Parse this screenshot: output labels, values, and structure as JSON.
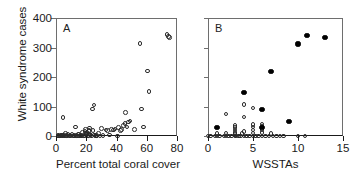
{
  "figure": {
    "ylabel": "White syndrome cases",
    "panels": [
      "A",
      "B"
    ]
  },
  "chart_data": [
    {
      "type": "scatter",
      "panel": "A",
      "title": "A",
      "xlabel": "Percent total coral cover",
      "ylabel": "White syndrome cases",
      "xlim": [
        0,
        80
      ],
      "ylim": [
        0,
        400
      ],
      "xticks": [
        0,
        20,
        40,
        60,
        80
      ],
      "yticks": [
        0,
        100,
        200,
        300,
        400
      ],
      "grid": false,
      "legend": "none",
      "marker": "open-circle",
      "series": [
        {
          "name": "survey sites",
          "marker": "open-circle",
          "points": [
            [
              1.2,
              2
            ],
            [
              1.8,
              0
            ],
            [
              2.5,
              1
            ],
            [
              3.0,
              0
            ],
            [
              3.6,
              4
            ],
            [
              4.2,
              0
            ],
            [
              4.6,
              62
            ],
            [
              5.1,
              3
            ],
            [
              5.6,
              0
            ],
            [
              6.2,
              8
            ],
            [
              6.8,
              1
            ],
            [
              7.4,
              0
            ],
            [
              8.0,
              6
            ],
            [
              8.6,
              0
            ],
            [
              9.2,
              2
            ],
            [
              10.0,
              0
            ],
            [
              10.6,
              5
            ],
            [
              11.2,
              0
            ],
            [
              11.8,
              1
            ],
            [
              12.4,
              0
            ],
            [
              13.0,
              30
            ],
            [
              13.6,
              2
            ],
            [
              14.2,
              0
            ],
            [
              15.0,
              7
            ],
            [
              15.6,
              0
            ],
            [
              16.2,
              3
            ],
            [
              17.0,
              0
            ],
            [
              17.6,
              11
            ],
            [
              18.2,
              1
            ],
            [
              18.8,
              0
            ],
            [
              19.2,
              16
            ],
            [
              19.6,
              22
            ],
            [
              19.9,
              9
            ],
            [
              20.2,
              5
            ],
            [
              20.6,
              13
            ],
            [
              21.0,
              0
            ],
            [
              21.4,
              2
            ],
            [
              21.8,
              19
            ],
            [
              22.2,
              27
            ],
            [
              22.6,
              7
            ],
            [
              23.0,
              3
            ],
            [
              23.5,
              0
            ],
            [
              24.0,
              92
            ],
            [
              24.4,
              18
            ],
            [
              25.0,
              105
            ],
            [
              25.5,
              4
            ],
            [
              26.0,
              0
            ],
            [
              26.6,
              1
            ],
            [
              27.2,
              0
            ],
            [
              28.0,
              9
            ],
            [
              29.0,
              0
            ],
            [
              30.0,
              25
            ],
            [
              31.0,
              2
            ],
            [
              33.0,
              20
            ],
            [
              34.0,
              18
            ],
            [
              35.5,
              3
            ],
            [
              36.5,
              22
            ],
            [
              38.0,
              20
            ],
            [
              39.0,
              24
            ],
            [
              40.5,
              0
            ],
            [
              41.5,
              28
            ],
            [
              42.5,
              19
            ],
            [
              43.5,
              23
            ],
            [
              44.5,
              36
            ],
            [
              45.5,
              42
            ],
            [
              46.0,
              80
            ],
            [
              47.0,
              30
            ],
            [
              48.0,
              48
            ],
            [
              49.0,
              51
            ],
            [
              52.0,
              22
            ],
            [
              55.5,
              314
            ],
            [
              56.5,
              91
            ],
            [
              58.0,
              30
            ],
            [
              60.5,
              221
            ],
            [
              61.5,
              150
            ],
            [
              73.5,
              345
            ],
            [
              74.5,
              338
            ],
            [
              75.0,
              333
            ]
          ]
        }
      ]
    },
    {
      "type": "scatter",
      "panel": "B",
      "title": "B",
      "xlabel": "WSSTAs",
      "ylabel": "White syndrome cases",
      "xlim": [
        0,
        15
      ],
      "ylim": [
        0,
        400
      ],
      "xticks": [
        0,
        5,
        10,
        15
      ],
      "yticks": [
        0,
        100,
        200,
        300,
        400
      ],
      "grid": false,
      "legend": "none",
      "series": [
        {
          "name": "low coral cover sites",
          "marker": "open-circle",
          "points": [
            [
              0.0,
              0
            ],
            [
              0.3,
              0
            ],
            [
              0.8,
              0
            ],
            [
              1.0,
              0
            ],
            [
              1.0,
              8
            ],
            [
              1.3,
              0
            ],
            [
              1.8,
              0
            ],
            [
              2.0,
              0
            ],
            [
              2.0,
              10
            ],
            [
              2.0,
              75
            ],
            [
              2.3,
              0
            ],
            [
              2.6,
              0
            ],
            [
              3.0,
              0
            ],
            [
              3.0,
              5
            ],
            [
              3.0,
              12
            ],
            [
              3.0,
              20
            ],
            [
              3.0,
              28
            ],
            [
              3.0,
              36
            ],
            [
              3.1,
              0
            ],
            [
              3.4,
              0
            ],
            [
              3.6,
              0
            ],
            [
              3.8,
              8
            ],
            [
              4.0,
              0
            ],
            [
              4.0,
              16
            ],
            [
              4.0,
              64
            ],
            [
              4.0,
              106
            ],
            [
              4.3,
              0
            ],
            [
              4.6,
              0
            ],
            [
              5.0,
              0
            ],
            [
              5.0,
              10
            ],
            [
              5.0,
              20
            ],
            [
              5.0,
              30
            ],
            [
              5.0,
              38
            ],
            [
              5.0,
              95
            ],
            [
              5.3,
              0
            ],
            [
              5.6,
              0
            ],
            [
              6.0,
              0
            ],
            [
              6.0,
              12
            ],
            [
              6.0,
              22
            ],
            [
              6.0,
              32
            ],
            [
              6.0,
              40
            ],
            [
              6.4,
              0
            ],
            [
              6.8,
              0
            ],
            [
              7.0,
              8
            ],
            [
              7.2,
              0
            ],
            [
              7.6,
              0
            ],
            [
              8.0,
              0
            ],
            [
              8.4,
              0
            ],
            [
              10.0,
              0
            ],
            [
              10.8,
              0
            ]
          ]
        },
        {
          "name": "high coral cover sites",
          "marker": "filled-circle",
          "points": [
            [
              1.0,
              30
            ],
            [
              4.0,
              148
            ],
            [
              6.0,
              90
            ],
            [
              6.0,
              30
            ],
            [
              7.0,
              220
            ],
            [
              9.0,
              50
            ],
            [
              10.0,
              312
            ],
            [
              11.0,
              340
            ],
            [
              13.0,
              333
            ]
          ]
        }
      ]
    }
  ],
  "panel_a": {
    "tag": "A",
    "xlabel": "Percent total coral cover",
    "xticklabels": [
      "0",
      "20",
      "40",
      "60",
      "80"
    ],
    "yticklabels": [
      "0",
      "100",
      "200",
      "300",
      "400"
    ]
  },
  "panel_b": {
    "tag": "B",
    "xlabel": "WSSTAs",
    "xticklabels": [
      "0",
      "5",
      "10",
      "15"
    ]
  },
  "colors": {
    "axis": "#1a1a1a",
    "frame": "#6e6e6e",
    "marker_open": "#2b2b2b",
    "marker_filled": "#000000",
    "background": "#ffffff"
  }
}
